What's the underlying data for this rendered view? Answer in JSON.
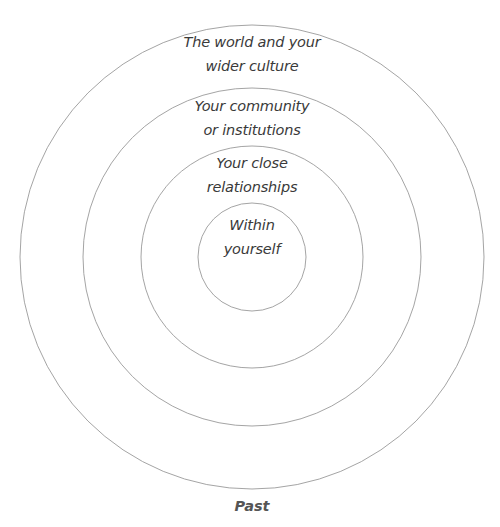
{
  "diagram": {
    "type": "concentric-circles",
    "rings": [
      {
        "id": "world",
        "lines": [
          "The world and your",
          "wider culture"
        ]
      },
      {
        "id": "community",
        "lines": [
          "Your community",
          "or institutions"
        ]
      },
      {
        "id": "relationships",
        "lines": [
          "Your close",
          "relationships"
        ]
      },
      {
        "id": "self",
        "lines": [
          "Within",
          "yourself"
        ]
      }
    ],
    "caption": "Past",
    "colors": {
      "stroke": "#9a9a9a",
      "text": "#3a3a3a",
      "caption": "#555555"
    }
  }
}
